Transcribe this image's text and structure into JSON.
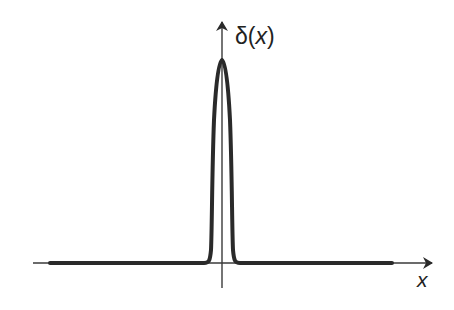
{
  "figure": {
    "y_axis_label": {
      "prefix": "δ(",
      "var": "x",
      "suffix": ")"
    },
    "x_axis_label": "x",
    "colors": {
      "curve": "#2a2a2a",
      "axis": "#3a3a3a",
      "background": "#ffffff"
    }
  }
}
